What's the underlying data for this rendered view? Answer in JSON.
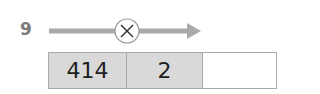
{
  "problem": {
    "number": "9",
    "operation": {
      "icon": "multiply-icon",
      "symbol": "×"
    },
    "cells": [
      {
        "value": "414",
        "filled": true
      },
      {
        "value": "2",
        "filled": true
      },
      {
        "value": "",
        "filled": false
      }
    ]
  },
  "colors": {
    "arrow": "#aaaaaa",
    "filled_cell": "#d9d9d9",
    "border": "#a9a9a9",
    "label": "#7a7a7a"
  }
}
